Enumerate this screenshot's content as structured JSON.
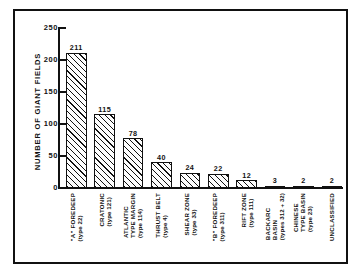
{
  "chart_data": {
    "type": "bar",
    "title": "",
    "subtitle": "",
    "xlabel": "",
    "ylabel": "NUMBER OF GIANT FIELDS",
    "ylim": [
      0,
      250
    ],
    "yticks": [
      0,
      50,
      100,
      150,
      200,
      250
    ],
    "ytick_labels": [
      "0",
      "50",
      "100",
      "150",
      "200",
      "250"
    ],
    "grid": false,
    "legend": "none",
    "bar_fill": "diagonal-hatch",
    "categories": [
      "\"A\" FOREDEEP",
      "CRATONIC",
      "ATLANTIC TYPE MARGIN",
      "THRUST BELT",
      "SHEAR ZONE",
      "\"B\" FOREDEEP",
      "RIFT ZONE",
      "BACKARC BASIN",
      "CHINESE TYPE BASIN",
      "UNCLASSIFIED"
    ],
    "category_sublabels": [
      "(type 22)",
      "(type 121)",
      "(type 114)",
      "(type 4)",
      "(type 33)",
      "(type 311)",
      "(type 111)",
      "(types 312 + 32)",
      "(type 23)",
      ""
    ],
    "values": [
      211,
      115,
      78,
      40,
      24,
      22,
      12,
      3,
      2,
      2
    ],
    "value_labels": [
      "211",
      "115",
      "78",
      "40",
      "24",
      "22",
      "12",
      "3",
      "2",
      "2"
    ]
  },
  "axis": {
    "y_title": "NUMBER OF GIANT FIELDS"
  },
  "colors": {
    "ink": "#111111",
    "paper": "#ffffff"
  }
}
